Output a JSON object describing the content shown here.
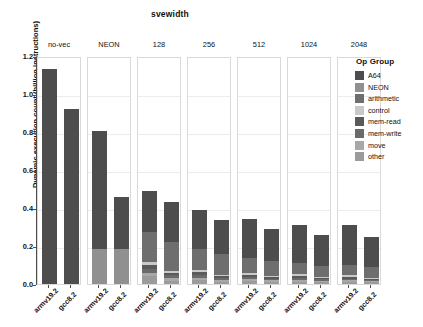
{
  "chart_data": {
    "type": "bar",
    "title": "svewidth",
    "xlabel": "",
    "ylabel": "Dynamic execution count (billion instructions)",
    "ylim": [
      0.0,
      1.2
    ],
    "ytick_labels": [
      "0.0",
      "0.2",
      "0.4",
      "0.6",
      "0.8",
      "1.0",
      "1.2"
    ],
    "ytick_values": [
      0.0,
      0.2,
      0.4,
      0.6,
      0.8,
      1.0,
      1.2
    ],
    "grid": true,
    "stacked": true,
    "legend_position": "right",
    "legend_title": "Op Group",
    "facet_variable": "svewidth",
    "facets": [
      "no-vec",
      "NEON",
      "128",
      "256",
      "512",
      "1024",
      "2048"
    ],
    "categories": [
      "armv19.2",
      "gcc8.2"
    ],
    "series": [
      {
        "name": "A64",
        "color": "#4d4d4d"
      },
      {
        "name": "NEON",
        "color": "#909090"
      },
      {
        "name": "arithmetic",
        "color": "#6e6e6e"
      },
      {
        "name": "control",
        "color": "#c9c9c9"
      },
      {
        "name": "mem-read",
        "color": "#5a5a5a"
      },
      {
        "name": "mem-write",
        "color": "#6a6a6a"
      },
      {
        "name": "move",
        "color": "#a8a8a8"
      },
      {
        "name": "other",
        "color": "#9b9b9b"
      }
    ],
    "panels": [
      {
        "facet": "no-vec",
        "bars": [
          {
            "category": "armv19.2",
            "total": 1.13,
            "segments": [
              {
                "name": "A64",
                "value": 1.13
              }
            ]
          },
          {
            "category": "gcc8.2",
            "total": 0.92,
            "segments": [
              {
                "name": "A64",
                "value": 0.92
              }
            ]
          }
        ]
      },
      {
        "facet": "NEON",
        "bars": [
          {
            "category": "armv19.2",
            "total": 0.805,
            "segments": [
              {
                "name": "NEON",
                "value": 0.185
              },
              {
                "name": "A64",
                "value": 0.62
              }
            ]
          },
          {
            "category": "gcc8.2",
            "total": 0.46,
            "segments": [
              {
                "name": "NEON",
                "value": 0.182
              },
              {
                "name": "A64",
                "value": 0.278
              }
            ]
          }
        ]
      },
      {
        "facet": "128",
        "bars": [
          {
            "category": "armv19.2",
            "total": 0.49,
            "segments": [
              {
                "name": "other",
                "value": 0.04
              },
              {
                "name": "move",
                "value": 0.02
              },
              {
                "name": "mem-write",
                "value": 0.018
              },
              {
                "name": "mem-read",
                "value": 0.02
              },
              {
                "name": "control",
                "value": 0.02
              },
              {
                "name": "arithmetic",
                "value": 0.155
              },
              {
                "name": "A64",
                "value": 0.217
              }
            ]
          },
          {
            "category": "gcc8.2",
            "total": 0.43,
            "segments": [
              {
                "name": "other",
                "value": 0.018
              },
              {
                "name": "move",
                "value": 0.015
              },
              {
                "name": "mem-write",
                "value": 0.012
              },
              {
                "name": "mem-read",
                "value": 0.012
              },
              {
                "name": "control",
                "value": 0.01
              },
              {
                "name": "arithmetic",
                "value": 0.152
              },
              {
                "name": "A64",
                "value": 0.211
              }
            ]
          }
        ]
      },
      {
        "facet": "256",
        "bars": [
          {
            "category": "armv19.2",
            "total": 0.39,
            "segments": [
              {
                "name": "other",
                "value": 0.02
              },
              {
                "name": "move",
                "value": 0.013
              },
              {
                "name": "mem-write",
                "value": 0.013
              },
              {
                "name": "mem-read",
                "value": 0.018
              },
              {
                "name": "control",
                "value": 0.012
              },
              {
                "name": "arithmetic",
                "value": 0.108
              },
              {
                "name": "A64",
                "value": 0.206
              }
            ]
          },
          {
            "category": "gcc8.2",
            "total": 0.335,
            "segments": [
              {
                "name": "other",
                "value": 0.013
              },
              {
                "name": "move",
                "value": 0.01
              },
              {
                "name": "mem-write",
                "value": 0.009
              },
              {
                "name": "mem-read",
                "value": 0.01
              },
              {
                "name": "control",
                "value": 0.008
              },
              {
                "name": "arithmetic",
                "value": 0.11
              },
              {
                "name": "A64",
                "value": 0.175
              }
            ]
          }
        ]
      },
      {
        "facet": "512",
        "bars": [
          {
            "category": "armv19.2",
            "total": 0.34,
            "segments": [
              {
                "name": "other",
                "value": 0.015
              },
              {
                "name": "move",
                "value": 0.01
              },
              {
                "name": "mem-write",
                "value": 0.01
              },
              {
                "name": "mem-read",
                "value": 0.014
              },
              {
                "name": "control",
                "value": 0.01
              },
              {
                "name": "arithmetic",
                "value": 0.078
              },
              {
                "name": "A64",
                "value": 0.203
              }
            ]
          },
          {
            "category": "gcc8.2",
            "total": 0.29,
            "segments": [
              {
                "name": "other",
                "value": 0.011
              },
              {
                "name": "move",
                "value": 0.008
              },
              {
                "name": "mem-write",
                "value": 0.008
              },
              {
                "name": "mem-read",
                "value": 0.009
              },
              {
                "name": "control",
                "value": 0.007
              },
              {
                "name": "arithmetic",
                "value": 0.076
              },
              {
                "name": "A64",
                "value": 0.171
              }
            ]
          }
        ]
      },
      {
        "facet": "1024",
        "bars": [
          {
            "category": "armv19.2",
            "total": 0.31,
            "segments": [
              {
                "name": "other",
                "value": 0.013
              },
              {
                "name": "move",
                "value": 0.009
              },
              {
                "name": "mem-write",
                "value": 0.009
              },
              {
                "name": "mem-read",
                "value": 0.012
              },
              {
                "name": "control",
                "value": 0.009
              },
              {
                "name": "arithmetic",
                "value": 0.06
              },
              {
                "name": "A64",
                "value": 0.198
              }
            ]
          },
          {
            "category": "gcc8.2",
            "total": 0.26,
            "segments": [
              {
                "name": "other",
                "value": 0.01
              },
              {
                "name": "move",
                "value": 0.007
              },
              {
                "name": "mem-write",
                "value": 0.007
              },
              {
                "name": "mem-read",
                "value": 0.008
              },
              {
                "name": "control",
                "value": 0.006
              },
              {
                "name": "arithmetic",
                "value": 0.057
              },
              {
                "name": "A64",
                "value": 0.165
              }
            ]
          }
        ]
      },
      {
        "facet": "2048",
        "bars": [
          {
            "category": "armv19.2",
            "total": 0.31,
            "segments": [
              {
                "name": "other",
                "value": 0.012
              },
              {
                "name": "move",
                "value": 0.008
              },
              {
                "name": "mem-write",
                "value": 0.008
              },
              {
                "name": "mem-read",
                "value": 0.011
              },
              {
                "name": "control",
                "value": 0.008
              },
              {
                "name": "arithmetic",
                "value": 0.055
              },
              {
                "name": "A64",
                "value": 0.208
              }
            ]
          },
          {
            "category": "gcc8.2",
            "total": 0.25,
            "segments": [
              {
                "name": "other",
                "value": 0.009
              },
              {
                "name": "move",
                "value": 0.006
              },
              {
                "name": "mem-write",
                "value": 0.006
              },
              {
                "name": "mem-read",
                "value": 0.007
              },
              {
                "name": "control",
                "value": 0.006
              },
              {
                "name": "arithmetic",
                "value": 0.054
              },
              {
                "name": "A64",
                "value": 0.162
              }
            ]
          }
        ]
      }
    ]
  }
}
